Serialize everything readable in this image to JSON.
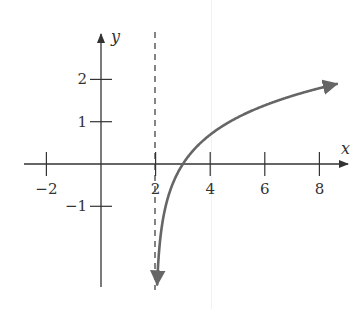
{
  "chart_data": {
    "type": "line",
    "title": "",
    "xlabel": "x",
    "ylabel": "y",
    "function": "y = ln(x - 2)",
    "xlim": [
      -3,
      9
    ],
    "ylim": [
      -3,
      3
    ],
    "x_ticks": [
      -2,
      2,
      4,
      6,
      8
    ],
    "x_tick_labels": [
      "−2",
      "2",
      "4",
      "6",
      "8"
    ],
    "y_ticks": [
      -1,
      1,
      2
    ],
    "y_tick_labels": [
      "−1",
      "1",
      "2"
    ],
    "asymptote": {
      "type": "vertical",
      "x": 2,
      "style": "dashed"
    },
    "series": [
      {
        "name": "ln(x-2)",
        "x": [
          2.1,
          2.2,
          2.5,
          3,
          4,
          5,
          6,
          7,
          8,
          8.5
        ],
        "values": [
          -2.3,
          -1.61,
          -0.69,
          0,
          0.69,
          1.1,
          1.39,
          1.61,
          1.79,
          1.87
        ]
      }
    ],
    "grid": false,
    "legend": null,
    "colors": {
      "axis": "#333333",
      "curve": "#666666",
      "asymptote": "#333333"
    }
  }
}
